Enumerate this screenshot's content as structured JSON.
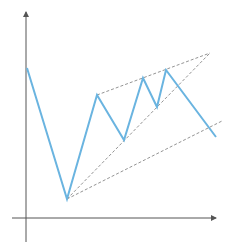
{
  "diagram": {
    "type": "price-pattern",
    "title": "",
    "colors": {
      "background": "#ffffff",
      "axis": "#555555",
      "price_line": "#6ab4e0",
      "trendline": "#888888"
    },
    "axes": {
      "y_axis": {
        "x": 26,
        "y_top": 12,
        "y_bottom": 242,
        "arrow": "up"
      },
      "x_axis": {
        "y": 218,
        "x_left": 12,
        "x_right": 216,
        "arrow": "right"
      }
    },
    "price_path": [
      [
        27,
        68
      ],
      [
        67,
        199
      ],
      [
        97,
        95
      ],
      [
        124,
        140
      ],
      [
        143,
        78
      ],
      [
        157,
        107
      ],
      [
        166,
        70
      ],
      [
        216,
        137
      ]
    ],
    "trendlines": [
      {
        "name": "upper-resistance",
        "from": [
          97,
          95
        ],
        "to": [
          210,
          53
        ],
        "style": "dashed"
      },
      {
        "name": "inner-support",
        "from": [
          67,
          199
        ],
        "to": [
          210,
          53
        ],
        "style": "dashed"
      },
      {
        "name": "lower-support",
        "from": [
          67,
          199
        ],
        "to": [
          222,
          121
        ],
        "style": "dashed"
      }
    ]
  }
}
